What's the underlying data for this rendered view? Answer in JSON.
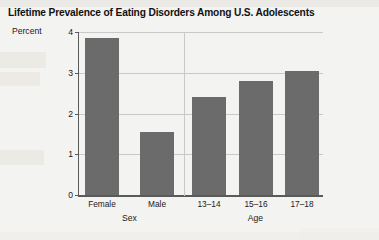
{
  "page": {
    "background_color": "#f3f3f1"
  },
  "chart_data": {
    "type": "bar",
    "title": "Lifetime Prevalence of Eating Disorders Among U.S. Adolescents",
    "xlabel": "",
    "ylabel": "",
    "y_unit_label": "Percent",
    "ylim": [
      0,
      4
    ],
    "yticks": [
      0,
      1,
      2,
      3,
      4
    ],
    "ytick_labels": [
      "0",
      "1",
      "2",
      "3",
      "4"
    ],
    "grid": true,
    "legend": "none",
    "bar_color": "#6b6b6b",
    "categories": [
      "Female",
      "Male",
      "13–14",
      "15–16",
      "17–18"
    ],
    "values": [
      3.85,
      1.55,
      2.4,
      2.8,
      3.05
    ],
    "groups": [
      {
        "label": "Sex",
        "categories": [
          "Female",
          "Male"
        ]
      },
      {
        "label": "Age",
        "categories": [
          "13–14",
          "15–16",
          "17–18"
        ]
      }
    ]
  }
}
